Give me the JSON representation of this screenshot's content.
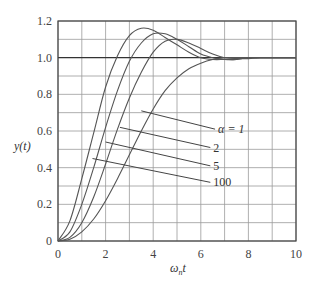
{
  "chart_data": {
    "type": "line",
    "title": "",
    "xlabel": "ω_n t",
    "ylabel": "y(t)",
    "xlim": [
      0,
      10
    ],
    "ylim": [
      0,
      1.2
    ],
    "grid": true,
    "x_ticks": [
      "0",
      "2",
      "4",
      "6",
      "8",
      "10"
    ],
    "y_ticks": [
      "0",
      "0.2",
      "0.4",
      "0.6",
      "0.8",
      "1.0",
      "1.2"
    ],
    "x": [
      0,
      0.5,
      1,
      1.5,
      2,
      2.5,
      3,
      3.5,
      4,
      4.5,
      5,
      5.5,
      6,
      6.5,
      7,
      7.5,
      8,
      8.5,
      9,
      9.5,
      10
    ],
    "series": [
      {
        "name": "α = 1",
        "label": "α = 1",
        "values": [
          0,
          0.01,
          0.05,
          0.12,
          0.22,
          0.34,
          0.47,
          0.6,
          0.72,
          0.82,
          0.89,
          0.94,
          0.97,
          0.99,
          1.0,
          1.0,
          1.0,
          1.0,
          1.0,
          1.0,
          1.0
        ]
      },
      {
        "name": "α = 2",
        "label": "2",
        "values": [
          0,
          0.02,
          0.1,
          0.24,
          0.42,
          0.61,
          0.78,
          0.92,
          1.03,
          1.09,
          1.1,
          1.08,
          1.05,
          1.02,
          1.0,
          0.995,
          0.995,
          1.0,
          1.0,
          1.0,
          1.0
        ]
      },
      {
        "name": "α = 5",
        "label": "5",
        "values": [
          0,
          0.05,
          0.2,
          0.4,
          0.62,
          0.82,
          0.98,
          1.08,
          1.13,
          1.13,
          1.1,
          1.06,
          1.02,
          1.0,
          0.99,
          0.99,
          1.0,
          1.0,
          1.0,
          1.0,
          1.0
        ]
      },
      {
        "name": "α = 100",
        "label": "100",
        "values": [
          0,
          0.11,
          0.34,
          0.59,
          0.84,
          1.01,
          1.12,
          1.16,
          1.15,
          1.11,
          1.07,
          1.03,
          1.0,
          0.99,
          0.99,
          0.99,
          1.0,
          1.0,
          1.0,
          1.0,
          1.0
        ]
      }
    ],
    "annotations": [
      {
        "text": "α = 1",
        "from": [
          3.5,
          0.71
        ],
        "to": [
          6.6,
          0.61
        ]
      },
      {
        "text": "2",
        "from": [
          2.6,
          0.62
        ],
        "to": [
          6.4,
          0.51
        ]
      },
      {
        "text": "5",
        "from": [
          2.0,
          0.54
        ],
        "to": [
          6.4,
          0.41
        ]
      },
      {
        "text": "100",
        "from": [
          1.45,
          0.45
        ],
        "to": [
          6.4,
          0.32
        ]
      }
    ]
  },
  "axes": {
    "xlabel_main": "ω",
    "xlabel_sub": "n",
    "xlabel_tail": "t",
    "ylabel": "y(t)"
  }
}
